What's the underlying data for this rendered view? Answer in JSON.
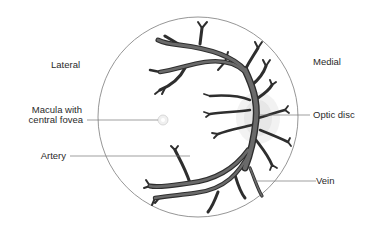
{
  "figure": {
    "orientation": {
      "left_label": "Lateral",
      "right_label": "Medial"
    },
    "labels": {
      "macula_line1": "Macula with",
      "macula_line2": "central fovea",
      "artery": "Artery",
      "optic_disc": "Optic disc",
      "vein": "Vein"
    },
    "colors": {
      "background": "#ffffff",
      "circle_outline": "#8a8a8a",
      "vessel_fill": "#5a5a5a",
      "vessel_outline": "#2a2a2a",
      "leader_line": "#777777",
      "label_text": "#2a2a2a"
    }
  }
}
